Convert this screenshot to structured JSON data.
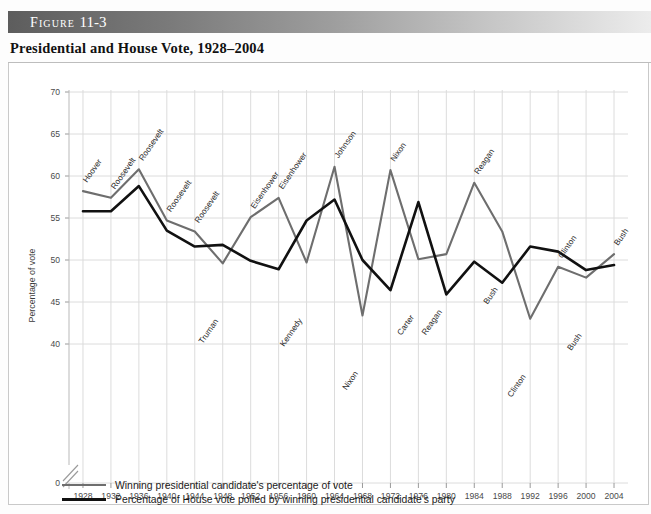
{
  "figure": {
    "band_prefix": "Figure",
    "band_number": "11-3",
    "title": "Presidential and House Vote, 1928–2004"
  },
  "legend": {
    "items": [
      {
        "label": "Winning presidential candidate's percentage of vote",
        "color": "#6e6e6e",
        "key": "pres"
      },
      {
        "label": "Percentage of House vote polled by winning presidential candidate's party",
        "color": "#111111",
        "key": "house"
      }
    ]
  },
  "chart_data": {
    "type": "line",
    "title": "Presidential and House Vote, 1928–2004",
    "xlabel": "",
    "ylabel": "Percentage of vote",
    "grid": true,
    "legend_position": "below",
    "axis_break": true,
    "ylim": [
      38,
      71
    ],
    "yticks": [
      0,
      40,
      45,
      50,
      55,
      60,
      65,
      70
    ],
    "categories": [
      1928,
      1932,
      1936,
      1940,
      1944,
      1948,
      1952,
      1956,
      1960,
      1964,
      1968,
      1972,
      1976,
      1980,
      1984,
      1988,
      1992,
      1996,
      2000,
      2004
    ],
    "xticklabels": [
      "1928",
      "1932",
      "1936",
      "1940",
      "1944",
      "1948",
      "1952",
      "1956",
      "1960",
      "1964",
      "1968",
      "1972",
      "1976",
      "1980",
      "1984",
      "1988",
      "1992",
      "1996",
      "2000",
      "2004"
    ],
    "series": [
      {
        "name": "Winning presidential candidate's percentage of vote",
        "color": "#6e6e6e",
        "values": [
          58.2,
          57.4,
          60.8,
          54.7,
          53.4,
          49.6,
          55.1,
          57.4,
          49.7,
          61.1,
          43.4,
          60.7,
          50.1,
          50.7,
          59.2,
          53.4,
          43.0,
          49.2,
          47.9,
          50.7
        ]
      },
      {
        "name": "Percentage of House vote polled by winning presidential candidate's party",
        "color": "#111111",
        "values": [
          55.8,
          55.8,
          58.8,
          53.5,
          51.6,
          51.8,
          49.9,
          48.9,
          54.7,
          57.2,
          50.0,
          46.4,
          56.9,
          45.9,
          49.8,
          47.3,
          51.6,
          51.0,
          48.8,
          49.4
        ]
      }
    ],
    "annotations": [
      {
        "text": "Hoover",
        "year": 1928,
        "value": 58.2,
        "series": "pres"
      },
      {
        "text": "Roosevelt",
        "year": 1932,
        "value": 57.4,
        "series": "pres"
      },
      {
        "text": "Roosevelt",
        "year": 1936,
        "value": 60.8,
        "series": "pres"
      },
      {
        "text": "Roosevelt",
        "year": 1940,
        "value": 54.7,
        "series": "pres"
      },
      {
        "text": "Roosevelt",
        "year": 1944,
        "value": 53.4,
        "series": "pres"
      },
      {
        "text": "Truman",
        "year": 1948,
        "value": 49.6,
        "series": "pres"
      },
      {
        "text": "Eisenhower",
        "year": 1952,
        "value": 55.1,
        "series": "pres"
      },
      {
        "text": "Eisenhower",
        "year": 1956,
        "value": 57.4,
        "series": "pres"
      },
      {
        "text": "Kennedy",
        "year": 1960,
        "value": 49.7,
        "series": "pres"
      },
      {
        "text": "Johnson",
        "year": 1964,
        "value": 61.1,
        "series": "pres"
      },
      {
        "text": "Nixon",
        "year": 1968,
        "value": 43.4,
        "series": "pres"
      },
      {
        "text": "Nixon",
        "year": 1972,
        "value": 60.7,
        "series": "pres"
      },
      {
        "text": "Carter",
        "year": 1976,
        "value": 50.1,
        "series": "pres"
      },
      {
        "text": "Reagan",
        "year": 1980,
        "value": 50.7,
        "series": "pres"
      },
      {
        "text": "Reagan",
        "year": 1984,
        "value": 59.2,
        "series": "pres"
      },
      {
        "text": "Bush",
        "year": 1988,
        "value": 53.4,
        "series": "pres"
      },
      {
        "text": "Clinton",
        "year": 1992,
        "value": 43.0,
        "series": "pres"
      },
      {
        "text": "Clinton",
        "year": 1996,
        "value": 49.2,
        "series": "pres"
      },
      {
        "text": "Bush",
        "year": 2000,
        "value": 47.9,
        "series": "pres"
      },
      {
        "text": "Bush",
        "year": 2004,
        "value": 50.7,
        "series": "pres"
      }
    ]
  }
}
